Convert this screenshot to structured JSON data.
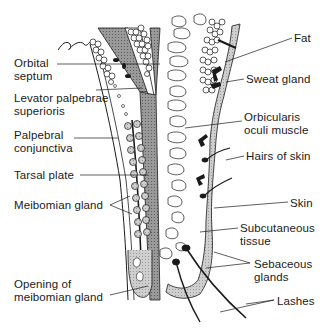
{
  "diagram": {
    "left_labels": [
      {
        "id": "orbital-septum",
        "text": "Orbital\nseptum",
        "x": 14,
        "y": 57
      },
      {
        "id": "levator",
        "text": "Levator palpebrae\nsuperioris",
        "x": 14,
        "y": 92
      },
      {
        "id": "palpebral-conjunctiva",
        "text": "Palpebral\nconjunctiva",
        "x": 14,
        "y": 129
      },
      {
        "id": "tarsal-plate",
        "text": "Tarsal plate",
        "x": 14,
        "y": 170
      },
      {
        "id": "meibomian-gland",
        "text": "Meibomian gland",
        "x": 14,
        "y": 200
      },
      {
        "id": "opening-meibomian",
        "text": "Opening of\nmeibomian gland",
        "x": 14,
        "y": 278
      }
    ],
    "right_labels": [
      {
        "id": "fat",
        "text": "Fat",
        "x": 294,
        "y": 32
      },
      {
        "id": "sweat-gland",
        "text": "Sweat gland",
        "x": 246,
        "y": 73
      },
      {
        "id": "orbicularis",
        "text": "Orbicularis\noculi muscle",
        "x": 244,
        "y": 111
      },
      {
        "id": "hairs-of-skin",
        "text": "Hairs of skin",
        "x": 246,
        "y": 150
      },
      {
        "id": "skin",
        "text": "Skin",
        "x": 290,
        "y": 198
      },
      {
        "id": "subcutaneous",
        "text": "Subcutaneous\ntissue",
        "x": 240,
        "y": 222
      },
      {
        "id": "sebaceous",
        "text": "Sebaceous\nglands",
        "x": 254,
        "y": 259
      },
      {
        "id": "lashes",
        "text": "Lashes",
        "x": 277,
        "y": 296
      }
    ],
    "colors": {
      "ink": "#1a1a1a",
      "shade": "#8c8c8c",
      "light_shade": "#c8c8c8",
      "background": "#ffffff"
    }
  }
}
